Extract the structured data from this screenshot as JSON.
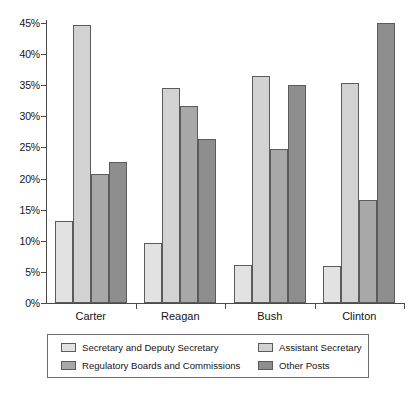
{
  "chart_data": {
    "type": "bar",
    "title": "",
    "subtitle": "",
    "xlabel": "",
    "ylabel": "",
    "categories": [
      "Carter",
      "Reagan",
      "Bush",
      "Clinton"
    ],
    "series": [
      {
        "name": "Secretary and Deputy Secretary",
        "color": "#e2e2e2",
        "values": [
          13.2,
          9.6,
          6.1,
          6.0
        ]
      },
      {
        "name": "Assistant Secretary",
        "color": "#d2d2d2",
        "values": [
          44.7,
          34.5,
          36.5,
          35.3
        ]
      },
      {
        "name": "Regulatory Boards and Commissions",
        "color": "#a8a8a8",
        "values": [
          20.7,
          31.6,
          24.7,
          16.5
        ]
      },
      {
        "name": "Other Posts",
        "color": "#8e8e8e",
        "values": [
          22.6,
          26.3,
          35.0,
          45.0
        ]
      }
    ],
    "ylim": [
      0,
      45
    ],
    "ytick_values": [
      0,
      5,
      10,
      15,
      20,
      25,
      30,
      35,
      40,
      45
    ],
    "ytick_labels": [
      "0%",
      "5%",
      "10%",
      "15%",
      "20%",
      "25%",
      "30%",
      "35%",
      "40%",
      "45%"
    ],
    "grid": false,
    "legend_position": "bottom",
    "legend_entries": [
      "Secretary and Deputy Secretary",
      "Assistant Secretary",
      "Regulatory Boards and Commissions",
      "Other Posts"
    ]
  },
  "colors": {
    "series_0": "#e2e2e2",
    "series_1": "#d2d2d2",
    "series_2": "#a8a8a8",
    "series_3": "#8e8e8e",
    "axis": "#4a4a4a",
    "bar_outline": "#5b5b5b",
    "text": "#141414",
    "background": "#ffffff"
  }
}
